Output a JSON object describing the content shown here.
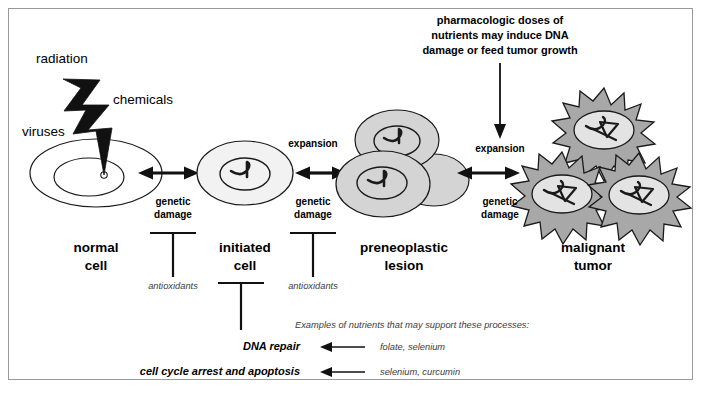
{
  "figure": {
    "border_color": "#9a9a9a",
    "background": "#ffffff"
  },
  "palette": {
    "stroke": "#1a1a1a",
    "normal_cell_fill": "#ffffff",
    "initiated_cell_fill": "#f2f2f2",
    "preneoplastic_fill": "#d4d4d4",
    "tumor_fill": "#a8a8a8",
    "tumor_nucleus_fill": "#e3e3e3",
    "bolt_fill": "#111111",
    "text": "#000000"
  },
  "insults": {
    "radiation": "radiation",
    "chemicals": "chemicals",
    "viruses": "viruses"
  },
  "stages": [
    {
      "id": "normal-cell",
      "label_line1": "normal",
      "label_line2": "cell"
    },
    {
      "id": "initiated-cell",
      "label_line1": "initiated",
      "label_line2": "cell"
    },
    {
      "id": "preneoplastic-lesion",
      "label_line1": "preneoplastic",
      "label_line2": "lesion"
    },
    {
      "id": "malignant-tumor",
      "label_line1": "malignant",
      "label_line2": "tumor"
    }
  ],
  "transitions": [
    {
      "id": "t1",
      "process_line1": "genetic",
      "process_line2": "damage",
      "expansion": ""
    },
    {
      "id": "t2",
      "process_line1": "genetic",
      "process_line2": "damage",
      "expansion": "expansion"
    },
    {
      "id": "t3",
      "process_line1": "genetic",
      "process_line2": "damage",
      "expansion": "expansion"
    }
  ],
  "inhibitors": [
    {
      "id": "antioxidants-1",
      "label": "antioxidants"
    },
    {
      "id": "antioxidants-2",
      "label": "antioxidants"
    }
  ],
  "pharmacologic_note": {
    "line1": "pharmacologic doses of",
    "line2": "nutrients may induce DNA",
    "line3": "damage or feed tumor growth"
  },
  "protective_processes": [
    {
      "id": "dna-repair",
      "label": "DNA repair",
      "nutrients": "folate, selenium"
    },
    {
      "id": "cell-cycle-arrest",
      "label": "cell cycle arrest and apoptosis",
      "nutrients": "selenium, curcumin"
    }
  ],
  "nutrients_caption": "Examples of nutrients that may support these processes:"
}
